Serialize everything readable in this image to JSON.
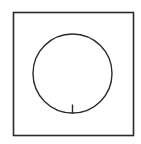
{
  "diagram": {
    "background": "#ffffff",
    "stroke_color": "#2a2a2a",
    "frame": {
      "x": 13.5,
      "y": 12.5,
      "width": 120,
      "height": 123,
      "stroke_width": 1.6
    },
    "circle": {
      "cx": 72.5,
      "cy": 73.5,
      "r": 39.5,
      "stroke_width": 1.4
    },
    "tick": {
      "x1": 72.5,
      "y1": 104.5,
      "x2": 72.5,
      "y2": 113.5,
      "stroke_width": 1.4
    }
  }
}
